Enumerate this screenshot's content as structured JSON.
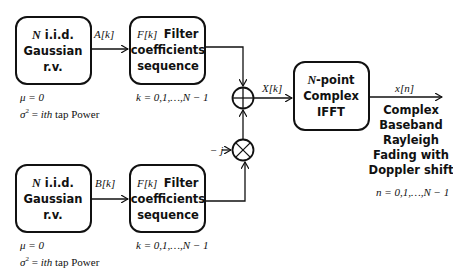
{
  "diagram": {
    "blocks": {
      "gauss_top": {
        "line1_var": "N",
        "line1": "i.i.d.",
        "line2": "Gaussian",
        "line3": "r.v.",
        "mu": "μ = 0",
        "sigma_var": "σ",
        "sigma_sup": "2",
        "sigma_eq": " = ",
        "sigma_ith": "ith",
        "sigma_rest": " tap Power"
      },
      "gauss_bottom": {
        "line1_var": "N",
        "line1": "i.i.d.",
        "line2": "Gaussian",
        "line3": "r.v.",
        "mu": "μ = 0",
        "sigma_var": "σ",
        "sigma_sup": "2",
        "sigma_eq": " = ",
        "sigma_ith": "ith",
        "sigma_rest": " tap Power"
      },
      "filter_top": {
        "prefix": "F[k]",
        "line1": "Filter",
        "line2": "coefficients",
        "line3": "sequence",
        "range": "k = 0,1,…,N − 1"
      },
      "filter_bottom": {
        "prefix": "F[k]",
        "line1": "Filter",
        "line2": "coefficients",
        "line3": "sequence",
        "range": "k = 0,1,…,N − 1"
      },
      "ifft": {
        "line1_var": "N",
        "line1": "-point",
        "line2": "Complex",
        "line3": "IFFT"
      }
    },
    "signals": {
      "a": "A[k]",
      "b": "B[k]",
      "x": "X[k]",
      "out": "x[n]",
      "neg_j": "− j"
    },
    "operators": {
      "adder": "summing-junction",
      "multiplier": "multiplier"
    },
    "output": {
      "line1": "Complex",
      "line2": "Baseband",
      "line3": "Rayleigh",
      "line4": "Fading with",
      "line5": "Doppler shift",
      "range": "n = 0,1,…,N − 1"
    }
  }
}
